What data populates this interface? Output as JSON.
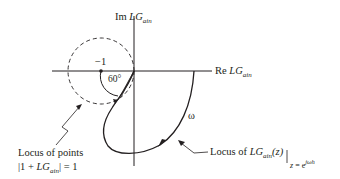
{
  "axes": {
    "imag_label_prefix": "Im",
    "imag_label_main": "LG",
    "imag_label_sub": "ain",
    "real_label_prefix": "Re",
    "real_label_main": "LG",
    "real_label_sub": "ain"
  },
  "annotations": {
    "critical_point": "−1",
    "angle": "60°",
    "omega": "ω"
  },
  "locus_circle_label": {
    "line1": "Locus of  points",
    "line2_a": "|1 + ",
    "line2_main": "LG",
    "line2_sub": "ain",
    "line2_b": "| = 1"
  },
  "locus_curve_label": {
    "prefix": "Locus of ",
    "main": "LG",
    "sub": "ain",
    "arg": "(z)",
    "eval_z": "z",
    "eval_eq": " = e",
    "eval_exp": "jωh"
  },
  "colors": {
    "ink": "#231f20",
    "background": "#ffffff"
  }
}
